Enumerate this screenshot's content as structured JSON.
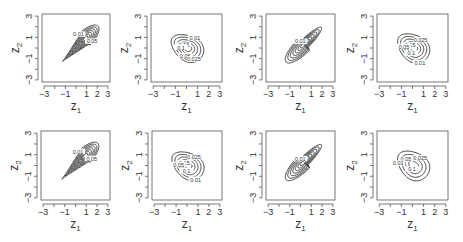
{
  "chart_data": {
    "type": "contour",
    "layout": {
      "rows": 2,
      "cols": 4
    },
    "colors": {
      "line": "#2a2a2a",
      "axis": "#555555",
      "text": "#333333",
      "background": "#ffffff"
    },
    "shared_axes": {
      "xlabel": "z1",
      "ylabel": "z2",
      "xlim": [
        -3.2,
        3.2
      ],
      "ylim": [
        -3.2,
        3.2
      ],
      "xticks": [
        -3,
        -2,
        -1,
        0,
        1,
        2,
        3
      ],
      "xtick_labels": [
        "-3",
        "",
        "-1",
        "",
        "1",
        "2",
        "3"
      ],
      "yticks": [
        -3,
        -2,
        -1,
        0,
        1,
        2,
        3
      ],
      "ytick_labels": [
        "-3",
        "",
        "-1",
        "",
        "1",
        "",
        "3"
      ],
      "grid": false,
      "legend": "none"
    },
    "panels": [
      {
        "row": 0,
        "col": 0,
        "box": [
          42,
          14,
          110,
          82
        ],
        "shape": "teardrop",
        "center": [
          0.9,
          0.9
        ],
        "angle_deg": 45,
        "spread": [
          2.3,
          0.55
        ],
        "levels": [
          0.01,
          0.05,
          0.1,
          0.15,
          0.2,
          0.25,
          0.3
        ],
        "labels": [
          {
            "text": "0.01",
            "level": 0
          },
          {
            "text": "0.05",
            "level": 1
          }
        ]
      },
      {
        "row": 0,
        "col": 1,
        "box": [
          151,
          14,
          222,
          82
        ],
        "shape": "egg",
        "center": [
          0.1,
          0.0
        ],
        "angle_deg": -35,
        "spread": [
          1.6,
          1.15
        ],
        "levels": [
          0.01,
          0.025,
          0.05,
          0.1,
          0.15
        ],
        "labels": [
          {
            "text": "0.01",
            "level": 0
          },
          {
            "text": "0.05",
            "level": 2
          },
          {
            "text": "0.15",
            "level": 4
          },
          {
            "text": "0.1",
            "level": 3
          },
          {
            "text": "0.025",
            "level": 1
          }
        ]
      },
      {
        "row": 0,
        "col": 2,
        "box": [
          266,
          14,
          335,
          82
        ],
        "shape": "ellipse-tail",
        "center": [
          0.3,
          0.3
        ],
        "angle_deg": 45,
        "spread": [
          2.3,
          0.6
        ],
        "levels": [
          0.01,
          0.05,
          0.1,
          0.15,
          0.2,
          0.25,
          0.3
        ],
        "labels": [
          {
            "text": "0.01",
            "level": 0
          }
        ]
      },
      {
        "row": 0,
        "col": 3,
        "box": [
          377,
          14,
          448,
          82
        ],
        "shape": "egg",
        "center": [
          0.1,
          0.0
        ],
        "angle_deg": -40,
        "spread": [
          1.6,
          1.2
        ],
        "levels": [
          0.01,
          0.025,
          0.05,
          0.1,
          0.15
        ],
        "labels": [
          {
            "text": "0.025",
            "level": 1
          },
          {
            "text": "0.1",
            "level": 3
          },
          {
            "text": "0.15",
            "level": 4
          },
          {
            "text": "0.05",
            "level": 2
          },
          {
            "text": "0.01",
            "level": 0
          }
        ]
      },
      {
        "row": 1,
        "col": 0,
        "box": [
          41,
          131,
          110,
          200
        ],
        "shape": "teardrop",
        "center": [
          0.9,
          0.9
        ],
        "angle_deg": 45,
        "spread": [
          2.3,
          0.55
        ],
        "levels": [
          0.01,
          0.05,
          0.1,
          0.15,
          0.2,
          0.25,
          0.3
        ],
        "labels": [
          {
            "text": "0.01",
            "level": 0
          },
          {
            "text": "0.05",
            "level": 1
          }
        ]
      },
      {
        "row": 1,
        "col": 1,
        "box": [
          152,
          131,
          222,
          200
        ],
        "shape": "egg",
        "center": [
          0.1,
          0.0
        ],
        "angle_deg": -35,
        "spread": [
          1.6,
          1.15
        ],
        "levels": [
          0.01,
          0.025,
          0.05,
          0.1,
          0.15
        ],
        "labels": [
          {
            "text": "0.025",
            "level": 1
          },
          {
            "text": "0.1",
            "level": 3
          },
          {
            "text": "0.15",
            "level": 4
          },
          {
            "text": "0.05",
            "level": 2
          },
          {
            "text": "0.01",
            "level": 0
          }
        ]
      },
      {
        "row": 1,
        "col": 2,
        "box": [
          266,
          131,
          335,
          200
        ],
        "shape": "ellipse-tail",
        "center": [
          0.3,
          0.3
        ],
        "angle_deg": 45,
        "spread": [
          2.3,
          0.6
        ],
        "levels": [
          0.01,
          0.05,
          0.1,
          0.15,
          0.2,
          0.25,
          0.3
        ],
        "labels": [
          {
            "text": "0.01",
            "level": 0
          }
        ]
      },
      {
        "row": 1,
        "col": 3,
        "box": [
          377,
          131,
          448,
          200
        ],
        "shape": "egg",
        "center": [
          0.1,
          0.0
        ],
        "angle_deg": -40,
        "spread": [
          1.6,
          1.2
        ],
        "levels": [
          0.01,
          0.025,
          0.05,
          0.1
        ],
        "labels": [
          {
            "text": "0.025",
            "level": 1
          },
          {
            "text": "0.1",
            "level": 3
          },
          {
            "text": "0.05",
            "level": 2
          },
          {
            "text": "0.01",
            "level": 0
          }
        ]
      }
    ]
  }
}
